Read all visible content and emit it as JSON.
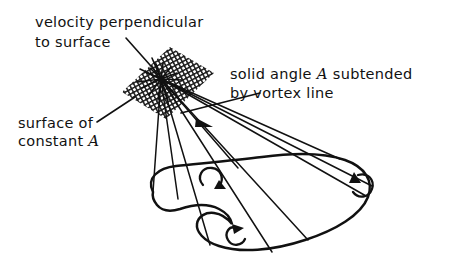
{
  "figure": {
    "name": "vortex-line-solid-angle-diagram",
    "background_color": "#ffffff",
    "ink_color": "#111111",
    "labels": {
      "velocity_line1": "velocity perpendicular",
      "velocity_line2": "to surface",
      "surface_line1": "surface of",
      "surface_line2_prefix": "constant ",
      "surface_line2_symbol": "A",
      "solid_angle_line1_prefix": "solid angle ",
      "solid_angle_line1_symbol": "A",
      "solid_angle_line1_suffix": " subtended",
      "solid_angle_line2": "by vortex line"
    },
    "elements": {
      "hatched_patch": "surface of constant A",
      "apex_point": "convergence point of velocity rays",
      "vortex_loop": "closed vortex line loop",
      "circulation_arrows": "three circulation direction arrows",
      "ray_bundle": "straight rays from apex to vortex loop"
    }
  }
}
